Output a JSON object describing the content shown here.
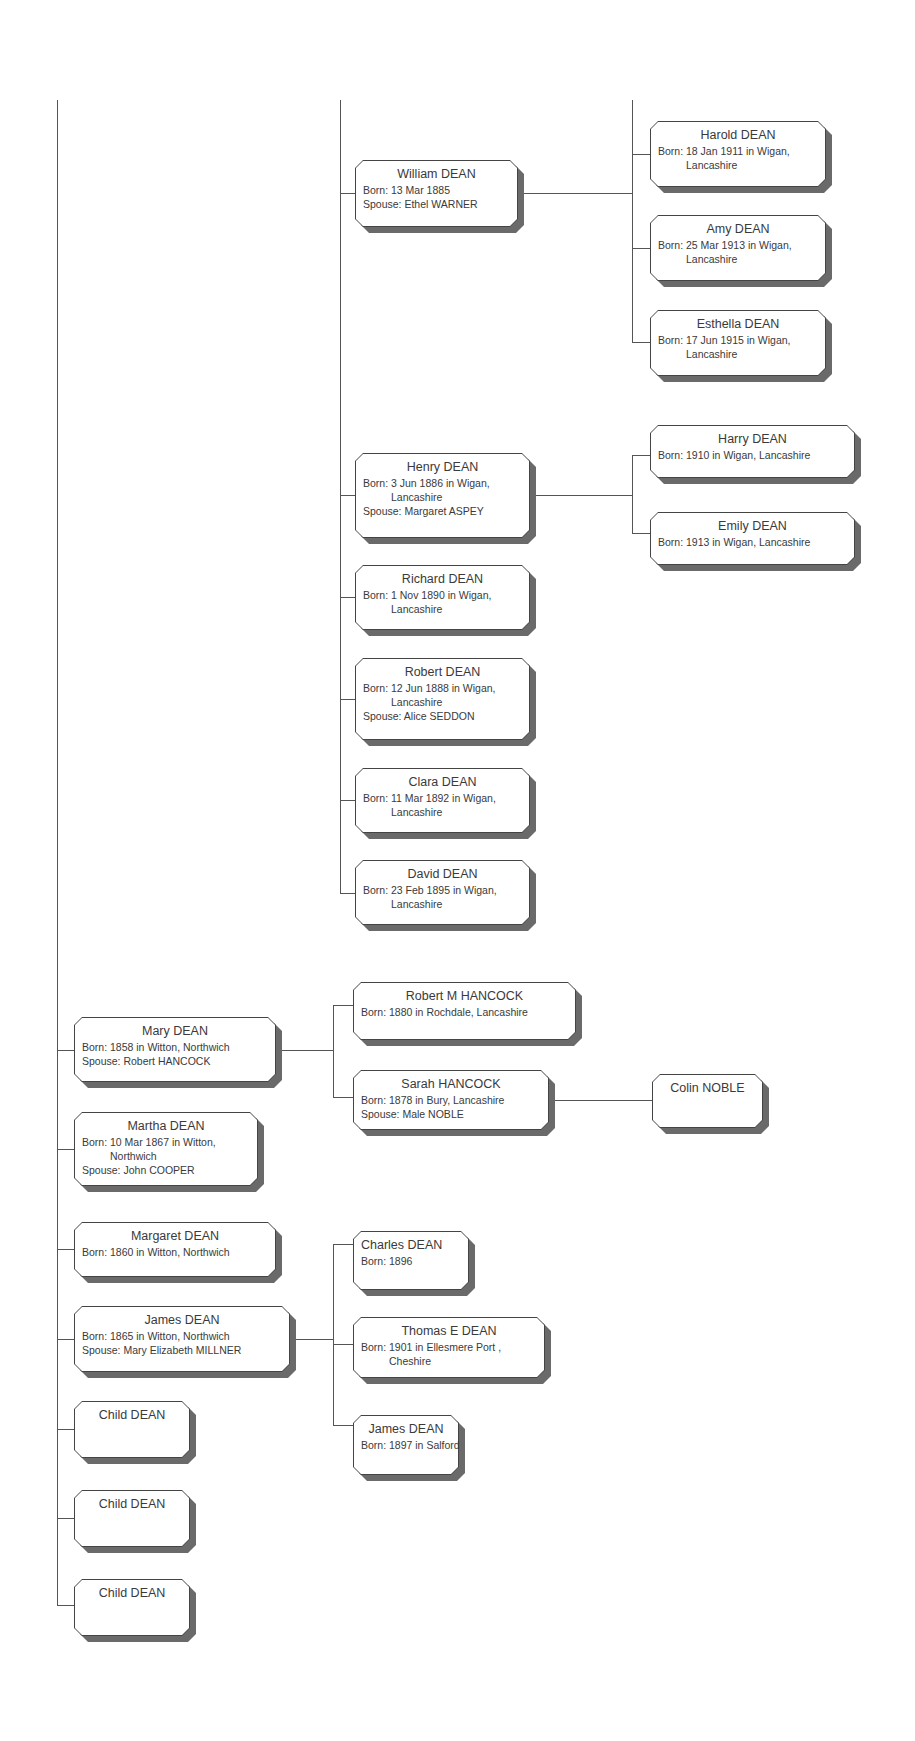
{
  "people": {
    "william": {
      "name": "William DEAN",
      "born": "Born: 13 Mar 1885",
      "spouse": "Spouse: Ethel WARNER"
    },
    "harold": {
      "name": "Harold DEAN",
      "born": "Born: 18 Jan 1911 in Wigan,",
      "born2": "Lancashire"
    },
    "amy": {
      "name": "Amy DEAN",
      "born": "Born: 25 Mar 1913 in Wigan,",
      "born2": "Lancashire"
    },
    "esthella": {
      "name": "Esthella DEAN",
      "born": "Born: 17 Jun 1915 in Wigan,",
      "born2": "Lancashire"
    },
    "henry": {
      "name": "Henry DEAN",
      "born": "Born: 3 Jun 1886 in Wigan,",
      "born2": "Lancashire",
      "spouse": "Spouse: Margaret ASPEY"
    },
    "harry": {
      "name": "Harry DEAN",
      "born": "Born: 1910 in Wigan, Lancashire"
    },
    "emily": {
      "name": "Emily DEAN",
      "born": "Born: 1913 in Wigan, Lancashire"
    },
    "richard": {
      "name": "Richard DEAN",
      "born": "Born: 1 Nov 1890 in Wigan,",
      "born2": "Lancashire"
    },
    "robert": {
      "name": "Robert DEAN",
      "born": "Born: 12 Jun 1888 in Wigan,",
      "born2": "Lancashire",
      "spouse": "Spouse: Alice SEDDON"
    },
    "clara": {
      "name": "Clara DEAN",
      "born": "Born: 11 Mar 1892 in Wigan,",
      "born2": "Lancashire"
    },
    "david": {
      "name": "David DEAN",
      "born": "Born: 23 Feb 1895 in Wigan,",
      "born2": "Lancashire"
    },
    "mary": {
      "name": "Mary DEAN",
      "born": "Born: 1858 in Witton, Northwich",
      "spouse": "Spouse: Robert HANCOCK"
    },
    "robert_m": {
      "name": "Robert M HANCOCK",
      "born": "Born: 1880 in Rochdale, Lancashire"
    },
    "sarah": {
      "name": "Sarah HANCOCK",
      "born": "Born: 1878 in Bury, Lancashire",
      "spouse": "Spouse: Male NOBLE"
    },
    "colin": {
      "name": "Colin NOBLE"
    },
    "martha": {
      "name": "Martha DEAN",
      "born": "Born: 10 Mar 1867 in Witton,",
      "born2": "Northwich",
      "spouse": "Spouse: John COOPER"
    },
    "margaret": {
      "name": "Margaret DEAN",
      "born": "Born: 1860 in Witton, Northwich"
    },
    "james": {
      "name": "James DEAN",
      "born": "Born: 1865 in Witton, Northwich",
      "spouse": "Spouse: Mary Elizabeth MILLNER"
    },
    "charles": {
      "name": "Charles DEAN",
      "born": "Born: 1896"
    },
    "thomas": {
      "name": "Thomas E DEAN",
      "born": "Born: 1901 in Ellesmere Port ,",
      "born2": "Cheshire"
    },
    "james_jr": {
      "name": "James DEAN",
      "born": "Born: 1897 in Salford"
    },
    "child1": {
      "name": "Child DEAN"
    },
    "child2": {
      "name": "Child DEAN"
    },
    "child3": {
      "name": "Child DEAN"
    }
  }
}
